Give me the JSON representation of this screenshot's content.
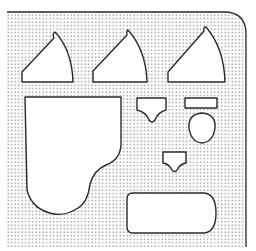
{
  "figure": {
    "colors": {
      "background": "#ffffff",
      "panel_dots": "#8a8a8a",
      "outline": "#2a2a2a",
      "cutout_fill": "#ffffff"
    }
  },
  "panel": {
    "left": 7,
    "top": 12,
    "right": 246,
    "bottom": 247,
    "corner_radius_top_right": 22
  },
  "shapes": [
    {
      "name": "wedge-1",
      "kind": "quarter-sector"
    },
    {
      "name": "wedge-2",
      "kind": "quarter-sector"
    },
    {
      "name": "wedge-3",
      "kind": "quarter-sector"
    },
    {
      "name": "grand-piano",
      "kind": "piano-outline"
    },
    {
      "name": "notched-trapezoid-large",
      "kind": "shield"
    },
    {
      "name": "small-rectangle",
      "kind": "rectangle"
    },
    {
      "name": "egg",
      "kind": "oval"
    },
    {
      "name": "notched-trapezoid-small",
      "kind": "shield"
    },
    {
      "name": "rounded-rectangle",
      "kind": "rounded-rect"
    }
  ]
}
